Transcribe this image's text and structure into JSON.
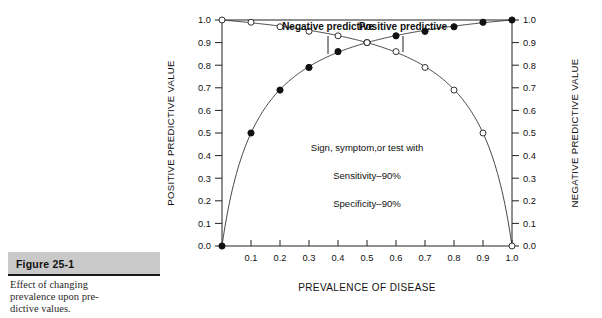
{
  "caption": {
    "figure_number": "Figure 25-1",
    "text": "Effect of changing prevalence upon pre-dictive values.",
    "line1": "Effect of changing",
    "line2": "prevalence upon pre-",
    "line3": "dictive values."
  },
  "chart_data": {
    "type": "line",
    "title": "",
    "xlabel": "PREVALENCE OF DISEASE",
    "ylabel": "POSITIVE PREDICTIVE VALUE",
    "y2label": "NEGATIVE PREDICTIVE VALUE",
    "xlim": [
      0.0,
      1.0
    ],
    "ylim": [
      0.0,
      1.0
    ],
    "y2lim": [
      0.0,
      1.0
    ],
    "grid": false,
    "legend_position": "inline-annotation",
    "xticks": [
      "0.1",
      "0.2",
      "0.3",
      "0.4",
      "0.5",
      "0.6",
      "0.7",
      "0.8",
      "0.9",
      "1.0"
    ],
    "xtick_values": [
      0.1,
      0.2,
      0.3,
      0.4,
      0.5,
      0.6,
      0.7,
      0.8,
      0.9,
      1.0
    ],
    "yticks": [
      "0.0",
      "0.1",
      "0.2",
      "0.3",
      "0.4",
      "0.5",
      "0.6",
      "0.7",
      "0.8",
      "0.9",
      "1.0"
    ],
    "ytick_values": [
      0.0,
      0.1,
      0.2,
      0.3,
      0.4,
      0.5,
      0.6,
      0.7,
      0.8,
      0.9,
      1.0
    ],
    "y2ticks": [
      "0.0",
      "0.1",
      "0.2",
      "0.3",
      "0.4",
      "0.5",
      "0.6",
      "0.7",
      "0.8",
      "0.9",
      "1.0"
    ],
    "y2tick_values": [
      0.0,
      0.1,
      0.2,
      0.3,
      0.4,
      0.5,
      0.6,
      0.7,
      0.8,
      0.9,
      1.0
    ],
    "x": [
      0.0,
      0.1,
      0.2,
      0.3,
      0.4,
      0.5,
      0.6,
      0.7,
      0.8,
      0.9,
      1.0
    ],
    "series": [
      {
        "name": "Positive predictive",
        "marker": "filled-circle",
        "axis": "left",
        "values": [
          0.0,
          0.5,
          0.69,
          0.79,
          0.86,
          0.9,
          0.93,
          0.95,
          0.97,
          0.99,
          1.0
        ]
      },
      {
        "name": "Negative predictive",
        "marker": "open-circle",
        "axis": "right",
        "values": [
          1.0,
          0.99,
          0.97,
          0.95,
          0.93,
          0.9,
          0.86,
          0.79,
          0.69,
          0.5,
          0.0
        ]
      }
    ],
    "annotations": [
      {
        "name": "negative-predictive-label",
        "text": "Negative predictive",
        "x": 0.38,
        "y": 1.07
      },
      {
        "name": "positive-predictive-label",
        "text": "Positive predictive",
        "x": 0.62,
        "y": 1.07
      }
    ],
    "note_lines": [
      "Sign, symptom,or test with",
      "Sensitivity–90%",
      "Specificity–90%"
    ],
    "colors": {
      "line": "#333333",
      "marker_fill": "#111111",
      "marker_open": "#ffffff",
      "frame": "#222222",
      "caption_bar": "#c9c9c9"
    }
  }
}
